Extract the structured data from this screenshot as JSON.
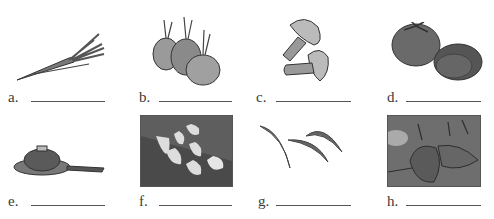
{
  "exercise": {
    "items": [
      {
        "letter": "a.",
        "picture": "carrot",
        "answer": ""
      },
      {
        "letter": "b.",
        "picture": "onions",
        "answer": ""
      },
      {
        "letter": "c.",
        "picture": "mushrooms",
        "answer": ""
      },
      {
        "letter": "d.",
        "picture": "tomato",
        "answer": ""
      },
      {
        "letter": "e.",
        "picture": "frying-pan",
        "answer": ""
      },
      {
        "letter": "f.",
        "picture": "garlic",
        "answer": ""
      },
      {
        "letter": "g.",
        "picture": "green-beans",
        "answer": ""
      },
      {
        "letter": "h.",
        "picture": "peppers",
        "answer": ""
      }
    ]
  }
}
